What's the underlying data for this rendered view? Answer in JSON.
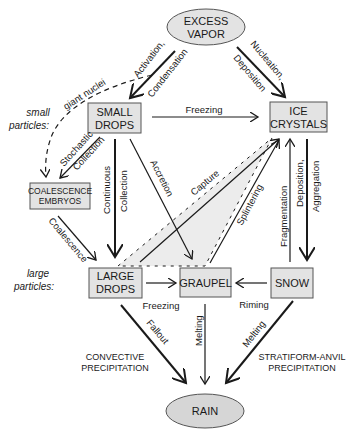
{
  "diagram": {
    "nodes": {
      "excess_vapor": {
        "line1": "EXCESS",
        "line2": "VAPOR",
        "shape": "ellipse"
      },
      "small_drops": {
        "line1": "SMALL",
        "line2": "DROPS",
        "shape": "box"
      },
      "ice_crystals": {
        "line1": "ICE",
        "line2": "CRYSTALS",
        "shape": "box"
      },
      "coalescence_embryos": {
        "line1": "COALESCENCE",
        "line2": "EMBRYOS",
        "shape": "box"
      },
      "large_drops": {
        "line1": "LARGE",
        "line2": "DROPS",
        "shape": "box"
      },
      "graupel": {
        "line1": "GRAUPEL",
        "shape": "box"
      },
      "snow": {
        "line1": "SNOW",
        "shape": "box"
      },
      "rain": {
        "line1": "RAIN",
        "shape": "ellipse"
      }
    },
    "side_labels": {
      "small_particles_1": "small",
      "small_particles_2": "particles:",
      "large_particles_1": "large",
      "large_particles_2": "particles:"
    },
    "edges": {
      "activation": "Activation,",
      "condensation": "Condensation",
      "nucleation": "Nucleation,",
      "deposition": "Deposition",
      "giant_nuclei": "giant nuclei",
      "freezing_top": "Freezing",
      "stochastic": "Stochastic",
      "collection": "Collection",
      "continuous": "Continuous",
      "continuous_collection": "Collection",
      "accretion": "Accretion",
      "capture": "Capture",
      "splintering": "Splintering",
      "fragmentation": "Fragmentation",
      "deposition2": "Deposition,",
      "aggregation": "Aggregation",
      "coalescence": "Coalescence",
      "freezing_bottom": "Freezing",
      "riming": "Riming",
      "fallout": "Fallout",
      "melting_center": "Melting",
      "melting_right": "Melting"
    },
    "captions": {
      "convective_1": "CONVECTIVE",
      "convective_2": "PRECIPITATION",
      "stratiform_1": "STRATIFORM-ANVIL",
      "stratiform_2": "PRECIPITATION"
    },
    "colors": {
      "node_fill": "#e3e3e3",
      "node_stroke": "#555555",
      "line": "#1a1a1a",
      "shaded_region": "#ececec"
    }
  }
}
